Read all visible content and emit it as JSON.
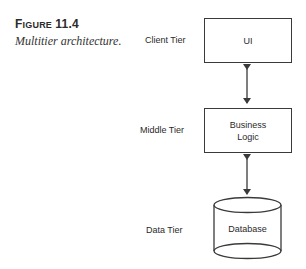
{
  "figure": {
    "label_prefix_first": "F",
    "label_prefix_rest": "IGURE",
    "label_number": "11.4",
    "caption": "Multitier architecture."
  },
  "tiers": [
    {
      "tier_label": "Client Tier",
      "component": "UI",
      "shape": "rectangle"
    },
    {
      "tier_label": "Middle Tier",
      "component_line1": "Business",
      "component_line2": "Logic",
      "shape": "rectangle"
    },
    {
      "tier_label": "Data Tier",
      "component": "Database",
      "shape": "cylinder"
    }
  ],
  "connectors": [
    {
      "from": "UI",
      "to": "Business Logic",
      "type": "bidirectional-arrow"
    },
    {
      "from": "Business Logic",
      "to": "Database",
      "type": "bidirectional-arrow"
    }
  ],
  "colors": {
    "stroke": "#3a3a3a",
    "text": "#2a2a2a",
    "background": "#ffffff"
  }
}
